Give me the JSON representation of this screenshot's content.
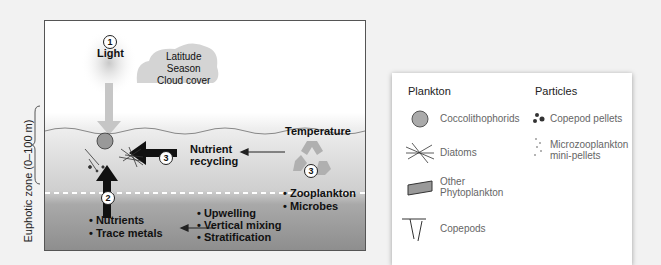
{
  "diagram": {
    "y_axis_label": "Euphotic zone (0–100 m)",
    "factors": {
      "light": {
        "number": "1",
        "label": "Light"
      },
      "cloud_text": [
        "Latitude",
        "Season",
        "Cloud cover"
      ],
      "temperature_label": "Temperature",
      "recycling": {
        "number": "3",
        "label_line1": "Nutrient",
        "label_line2": "recycling"
      },
      "recycling_agents": [
        "• Zooplankton",
        "• Microbes"
      ],
      "nutrients_number": "2",
      "nutrients": [
        "• Nutrients",
        "• Trace metals"
      ],
      "physical_processes": [
        "• Upwelling",
        "• Vertical mixing",
        "• Stratification"
      ]
    }
  },
  "legend": {
    "plankton_title": "Plankton",
    "particles_title": "Particles",
    "plankton": [
      "Coccolithophorids",
      "Diatoms",
      "Other",
      "Phytoplankton",
      "Copepods"
    ],
    "particles": [
      "Copepod pellets",
      "Microzooplankton",
      "mini-pellets"
    ]
  }
}
